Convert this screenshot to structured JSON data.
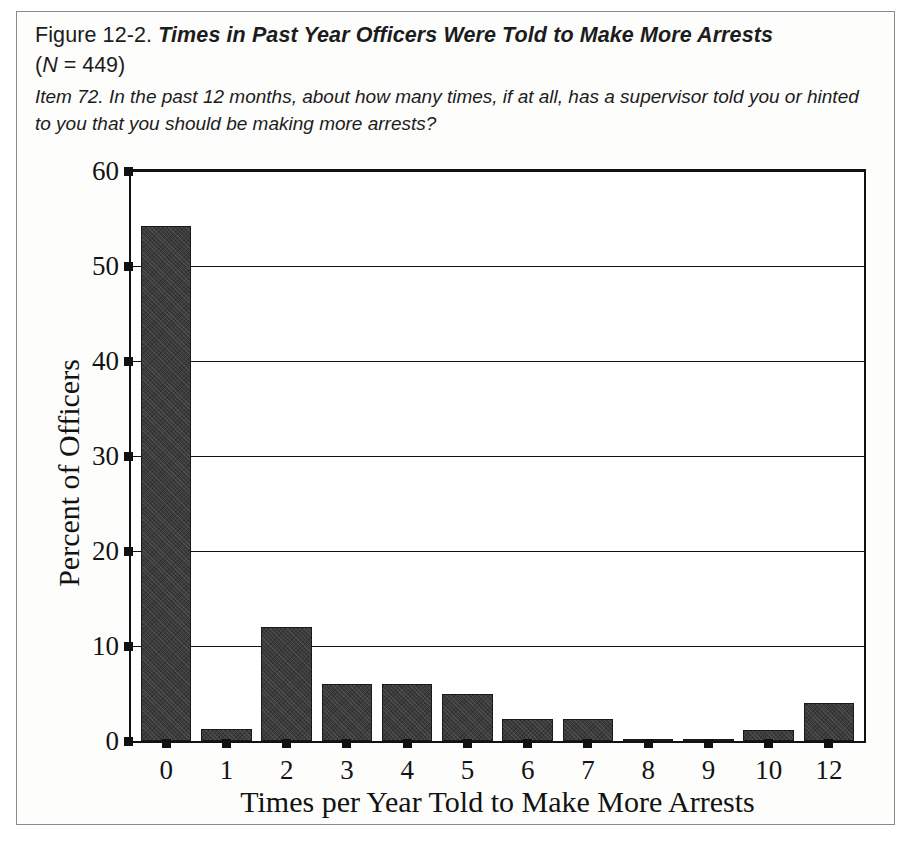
{
  "caption": {
    "figure_label": "Figure 12-2.",
    "figure_title": "Times in Past Year Officers Were Told to Make More Arrests",
    "n_prefix": "(",
    "n_italic": "N",
    "n_suffix": " = 449)",
    "item_text": "Item 72. In the past 12 months, about how many times, if at all, has a supervisor told you or hinted to you that you should be making more arrests?"
  },
  "chart_data": {
    "type": "bar",
    "title": "Times in Past Year Officers Were Told to Make More Arrests",
    "subtitle": "Item 72. In the past 12 months, about how many times, if at all, has a supervisor told you or hinted to you that you should be making more arrests?",
    "xlabel": "Times per Year Told to Make More Arrests",
    "ylabel": "Percent of Officers",
    "categories": [
      "0",
      "1",
      "2",
      "3",
      "4",
      "5",
      "6",
      "7",
      "8",
      "9",
      "10",
      "12"
    ],
    "values": [
      54.2,
      1.3,
      12.0,
      6.0,
      6.0,
      5.0,
      2.3,
      2.3,
      0.2,
      0.2,
      1.2,
      4.0
    ],
    "ylim": [
      0,
      60
    ],
    "yticks": [
      0,
      10,
      20,
      30,
      40,
      50,
      60
    ],
    "ytick_labels": [
      "0",
      "10",
      "20",
      "30",
      "40",
      "50",
      "60"
    ],
    "grid": true,
    "grid_axis": "y",
    "legend": false,
    "n": 449,
    "bar_color": "#3b3b3b",
    "axis_color": "#111111"
  }
}
